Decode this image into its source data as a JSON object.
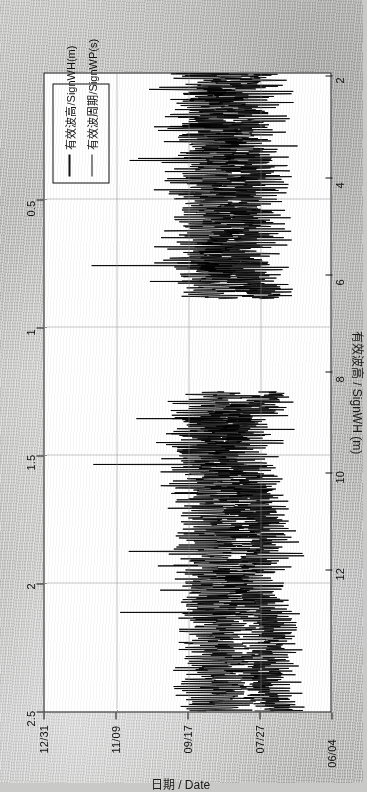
{
  "figure": {
    "background_color": "#c9c9c7",
    "plot_background": "#ffffff",
    "line_color": "#000000",
    "rotation_note": "chart rendered rotated 90 degrees counter-clockwise on scanned page"
  },
  "legend": {
    "items": [
      {
        "label": "有效波高/SignWH(m)",
        "swatch": "line-swatch"
      },
      {
        "label": "有效波周期/SignWP(s)",
        "swatch": "line-swatch"
      }
    ]
  },
  "chart_data": {
    "type": "line",
    "title": "",
    "xlabel": "日期 / Date",
    "ylabel": "有效波高 / SignWH (m)",
    "y2label": "有效波周期 / SignWP (s)",
    "grid": true,
    "legend_position": "top-left-rotated",
    "x_tick_labels": [
      "06/04",
      "07/27",
      "09/17",
      "11/09",
      "12/31"
    ],
    "x_tick_positions": [
      0,
      0.25,
      0.5,
      0.75,
      1.0
    ],
    "y_tick_labels": [
      "0.5",
      "1",
      "1.5",
      "2",
      "2.5"
    ],
    "y_tick_values": [
      0.5,
      1,
      1.5,
      2,
      2.5
    ],
    "ylim": [
      0,
      2.75
    ],
    "y2_tick_labels": [
      "2",
      "4",
      "6",
      "8",
      "10",
      "12"
    ],
    "y2_tick_values": [
      2,
      4,
      6,
      8,
      10,
      12
    ],
    "y2lim": [
      0,
      13.2
    ],
    "series": [
      {
        "name": "有效波高/SignWH(m)",
        "axis": "left",
        "unit": "m",
        "description": "significant wave height, dense daily oscillation 0.1-2.2 m with storm spikes; data gap 09/17-10/20",
        "approx_range": [
          0.1,
          2.2
        ]
      },
      {
        "name": "有效波周期/SignWP(s)",
        "axis": "right",
        "unit": "s",
        "description": "significant wave period, dense oscillation 3-9 s with peaks to 11 s; data gap 09/17-10/20",
        "approx_range": [
          2.8,
          11.0
        ]
      }
    ],
    "data_gap": {
      "from": "09/17",
      "to": "10/20"
    }
  }
}
